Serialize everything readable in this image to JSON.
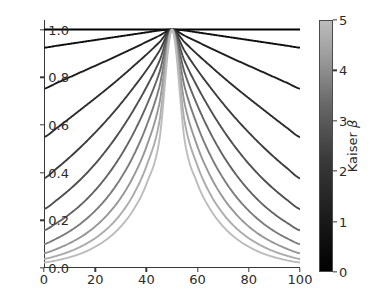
{
  "figure": {
    "width": 375,
    "height": 297,
    "background": "#ffffff"
  },
  "chart_data": {
    "type": "line",
    "title": "",
    "xlabel": "",
    "ylabel": "",
    "xlim": [
      0,
      100
    ],
    "ylim": [
      0.0,
      1.04
    ],
    "grid": false,
    "x_ticks": [
      0,
      20,
      40,
      60,
      80,
      100
    ],
    "x_tick_labels": [
      "0",
      "20",
      "40",
      "60",
      "80",
      "100"
    ],
    "y_ticks": [
      0.0,
      0.2,
      0.4,
      0.6,
      0.8,
      1.0
    ],
    "y_tick_labels": [
      "0.0",
      "0.2",
      "0.4",
      "0.6",
      "0.8",
      "1.0"
    ],
    "colormap": "gray",
    "colorbar": {
      "label": "Kaiser ",
      "label_symbol": "β",
      "ticks": [
        0,
        1,
        2,
        3,
        4,
        5
      ],
      "tick_labels": [
        "0",
        "1",
        "2",
        "3",
        "4",
        "5"
      ],
      "vmin": 0,
      "vmax": 5,
      "orientation": "vertical",
      "position": "right",
      "color_low": "#000000",
      "color_high": "#bcbcbc"
    },
    "legend": null,
    "series": [
      {
        "name": "β = 0.0",
        "beta": 0.0,
        "color": "#000000",
        "endpoint_y": 1.0
      },
      {
        "name": "β = 0.5",
        "beta": 0.5,
        "color": "#0f0f0f",
        "endpoint_y": 0.924
      },
      {
        "name": "β = 1.0",
        "beta": 1.0,
        "color": "#1e1e1e",
        "endpoint_y": 0.752
      },
      {
        "name": "β = 1.5",
        "beta": 1.5,
        "color": "#2d2d2d",
        "endpoint_y": 0.549
      },
      {
        "name": "β = 2.0",
        "beta": 2.0,
        "color": "#3d3d3d",
        "endpoint_y": 0.376
      },
      {
        "name": "β = 2.5",
        "beta": 2.5,
        "color": "#4f4f4f",
        "endpoint_y": 0.247
      },
      {
        "name": "β = 3.0",
        "beta": 3.0,
        "color": "#646464",
        "endpoint_y": 0.158
      },
      {
        "name": "β = 3.5",
        "beta": 3.5,
        "color": "#7c7c7c",
        "endpoint_y": 0.1
      },
      {
        "name": "β = 4.0",
        "beta": 4.0,
        "color": "#979797",
        "endpoint_y": 0.062
      },
      {
        "name": "β = 4.5",
        "beta": 4.5,
        "color": "#ababab",
        "endpoint_y": 0.038
      },
      {
        "name": "β = 5.0",
        "beta": 5.0,
        "color": "#bcbcbc",
        "endpoint_y": 0.023
      }
    ],
    "x": [
      0,
      5,
      10,
      15,
      20,
      25,
      30,
      35,
      40,
      45,
      50,
      55,
      60,
      65,
      70,
      75,
      80,
      85,
      90,
      95,
      100
    ],
    "series_values": [
      [
        1.0,
        1.0,
        1.0,
        1.0,
        1.0,
        1.0,
        1.0,
        1.0,
        1.0,
        1.0,
        1.0,
        1.0,
        1.0,
        1.0,
        1.0,
        1.0,
        1.0,
        1.0,
        1.0,
        1.0,
        1.0
      ],
      [
        0.924,
        0.932,
        0.94,
        0.948,
        0.956,
        0.964,
        0.972,
        0.98,
        0.988,
        0.996,
        1.0,
        0.996,
        0.988,
        0.98,
        0.972,
        0.964,
        0.956,
        0.948,
        0.94,
        0.932,
        0.924
      ],
      [
        0.752,
        0.776,
        0.8,
        0.824,
        0.848,
        0.872,
        0.897,
        0.922,
        0.948,
        0.974,
        1.0,
        0.974,
        0.948,
        0.922,
        0.897,
        0.872,
        0.848,
        0.824,
        0.8,
        0.776,
        0.752
      ],
      [
        0.549,
        0.587,
        0.628,
        0.67,
        0.712,
        0.755,
        0.8,
        0.847,
        0.895,
        0.946,
        1.0,
        0.946,
        0.895,
        0.847,
        0.8,
        0.755,
        0.712,
        0.67,
        0.628,
        0.587,
        0.549
      ],
      [
        0.376,
        0.418,
        0.464,
        0.514,
        0.568,
        0.626,
        0.689,
        0.757,
        0.829,
        0.909,
        1.0,
        0.909,
        0.829,
        0.757,
        0.689,
        0.626,
        0.568,
        0.514,
        0.464,
        0.418,
        0.376
      ],
      [
        0.247,
        0.285,
        0.329,
        0.379,
        0.437,
        0.503,
        0.578,
        0.663,
        0.758,
        0.866,
        1.0,
        0.866,
        0.758,
        0.663,
        0.578,
        0.503,
        0.437,
        0.379,
        0.329,
        0.285,
        0.247
      ],
      [
        0.158,
        0.189,
        0.226,
        0.271,
        0.326,
        0.392,
        0.471,
        0.566,
        0.68,
        0.817,
        1.0,
        0.817,
        0.68,
        0.566,
        0.471,
        0.392,
        0.326,
        0.271,
        0.226,
        0.189,
        0.158
      ],
      [
        0.1,
        0.124,
        0.154,
        0.192,
        0.24,
        0.3,
        0.376,
        0.472,
        0.595,
        0.757,
        1.0,
        0.757,
        0.595,
        0.472,
        0.376,
        0.3,
        0.24,
        0.192,
        0.154,
        0.124,
        0.1
      ],
      [
        0.062,
        0.08,
        0.104,
        0.134,
        0.174,
        0.226,
        0.294,
        0.385,
        0.508,
        0.686,
        1.0,
        0.686,
        0.508,
        0.385,
        0.294,
        0.226,
        0.174,
        0.134,
        0.104,
        0.08,
        0.062
      ],
      [
        0.038,
        0.051,
        0.069,
        0.093,
        0.125,
        0.168,
        0.227,
        0.309,
        0.427,
        0.609,
        1.0,
        0.609,
        0.427,
        0.309,
        0.227,
        0.168,
        0.125,
        0.093,
        0.069,
        0.051,
        0.038
      ],
      [
        0.023,
        0.032,
        0.045,
        0.063,
        0.089,
        0.124,
        0.174,
        0.245,
        0.352,
        0.531,
        1.0,
        0.531,
        0.352,
        0.245,
        0.174,
        0.124,
        0.089,
        0.063,
        0.045,
        0.032,
        0.023
      ]
    ]
  }
}
